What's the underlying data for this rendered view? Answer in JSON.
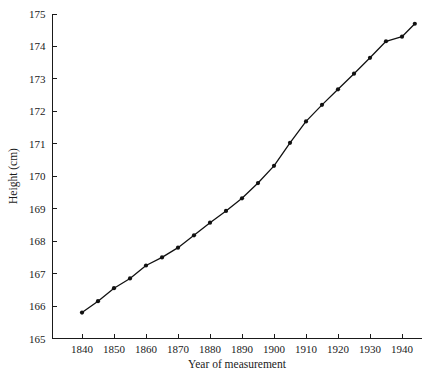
{
  "chart_data": {
    "type": "line",
    "title": "",
    "xlabel": "Year of measurement",
    "ylabel": "Height (cm)",
    "xlim": [
      1836,
      1946
    ],
    "ylim": [
      165,
      175
    ],
    "grid": false,
    "legend": null,
    "xticks": [
      1840,
      1850,
      1860,
      1870,
      1880,
      1890,
      1900,
      1910,
      1920,
      1930,
      1940
    ],
    "xtick_labels": [
      "1840",
      "1850",
      "1860",
      "1870",
      "1880",
      "1890",
      "1900",
      "1910",
      "1920",
      "1930",
      "1940"
    ],
    "yticks": [
      165,
      166,
      167,
      168,
      169,
      170,
      171,
      172,
      173,
      174,
      175
    ],
    "ytick_labels": [
      "165",
      "166",
      "167",
      "168",
      "169",
      "170",
      "171",
      "172",
      "173",
      "174",
      "175"
    ],
    "series": [
      {
        "name": "Height",
        "marker": "filled-circle",
        "color": "#111111",
        "x": [
          1840,
          1845,
          1850,
          1855,
          1860,
          1865,
          1870,
          1875,
          1880,
          1885,
          1890,
          1895,
          1900,
          1905,
          1910,
          1915,
          1920,
          1925,
          1930,
          1935,
          1940,
          1944
        ],
        "y": [
          165.8,
          166.15,
          166.55,
          166.85,
          167.25,
          167.5,
          167.8,
          168.18,
          168.57,
          168.93,
          169.32,
          169.79,
          170.32,
          171.03,
          171.69,
          172.2,
          172.68,
          173.16,
          173.65,
          174.16,
          174.3,
          174.7
        ]
      }
    ]
  },
  "axes": {
    "x_axis_name": "x-axis",
    "y_axis_name": "y-axis"
  }
}
